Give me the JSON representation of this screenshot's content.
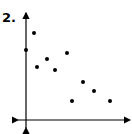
{
  "problem": {
    "number_label": "2."
  },
  "chart_data": {
    "type": "scatter",
    "title": "",
    "xlabel": "",
    "ylabel": "",
    "grid": false,
    "ticks": false,
    "axes": {
      "x_arrows": "both",
      "y_arrows": "both"
    },
    "points_pixel": [
      [
        26,
        50
      ],
      [
        34,
        33
      ],
      [
        37,
        67
      ],
      [
        47,
        59
      ],
      [
        55,
        70
      ],
      [
        67,
        53
      ],
      [
        72,
        101
      ],
      [
        83,
        82
      ],
      [
        94,
        91
      ],
      [
        110,
        101
      ]
    ],
    "points": [
      {
        "x": 0.0,
        "y": 7.0
      },
      {
        "x": 0.8,
        "y": 8.7
      },
      {
        "x": 1.1,
        "y": 5.3
      },
      {
        "x": 2.1,
        "y": 6.1
      },
      {
        "x": 2.9,
        "y": 5.0
      },
      {
        "x": 4.1,
        "y": 6.7
      },
      {
        "x": 4.6,
        "y": 1.9
      },
      {
        "x": 5.7,
        "y": 3.8
      },
      {
        "x": 6.8,
        "y": 2.9
      },
      {
        "x": 8.4,
        "y": 1.9
      }
    ],
    "trend": "negative correlation",
    "color": "#000000"
  }
}
